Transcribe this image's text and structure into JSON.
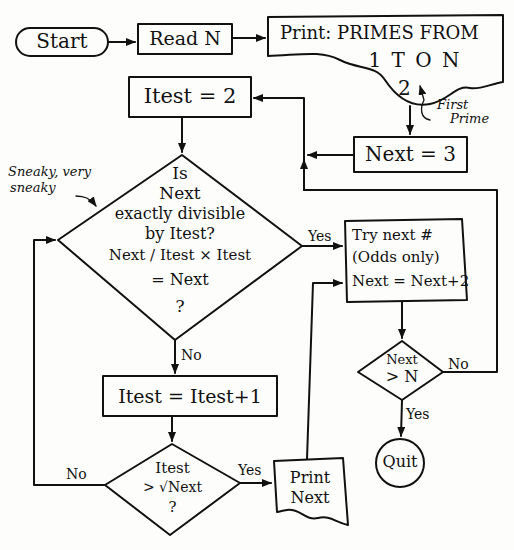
{
  "diagram": {
    "nodes": {
      "start": {
        "label": "Start",
        "shape": "terminal"
      },
      "read_n": {
        "label": "Read N",
        "shape": "process"
      },
      "print_header": {
        "line1": "Print: PRIMES FROM",
        "line2": "1 T O N",
        "line3": "2",
        "shape": "document"
      },
      "first_prime_note": {
        "line1": "First",
        "line2": "Prime"
      },
      "next_init": {
        "label": "Next = 3",
        "shape": "process"
      },
      "itest_init": {
        "label": "Itest = 2",
        "shape": "process"
      },
      "divisible_check": {
        "lines": [
          "Is",
          "Next",
          "exactly divisible",
          "by  Itest?",
          "Next / Itest × Itest",
          "= Next",
          "?"
        ],
        "shape": "decision"
      },
      "sneaky_note": {
        "line1": "Sneaky, very",
        "line2": "sneaky"
      },
      "try_next": {
        "lines": [
          "Try next #",
          "(Odds only)",
          "Next = Next+2"
        ],
        "shape": "process"
      },
      "next_gt_n": {
        "line1": "Next",
        "line2": "> N",
        "shape": "decision"
      },
      "quit": {
        "label": "Quit",
        "shape": "terminal"
      },
      "itest_inc": {
        "label": "Itest = Itest+1",
        "shape": "process"
      },
      "sqrt_check": {
        "line1": "Itest",
        "line2": "> √Next",
        "line3": "?",
        "shape": "decision"
      },
      "print_next": {
        "line1": "Print",
        "line2": "Next",
        "shape": "document"
      }
    },
    "edge_labels": {
      "divisible_yes": "Yes",
      "divisible_no": "No",
      "next_gt_n_no": "No",
      "next_gt_n_yes": "Yes",
      "sqrt_no": "No",
      "sqrt_yes": "Yes"
    }
  }
}
